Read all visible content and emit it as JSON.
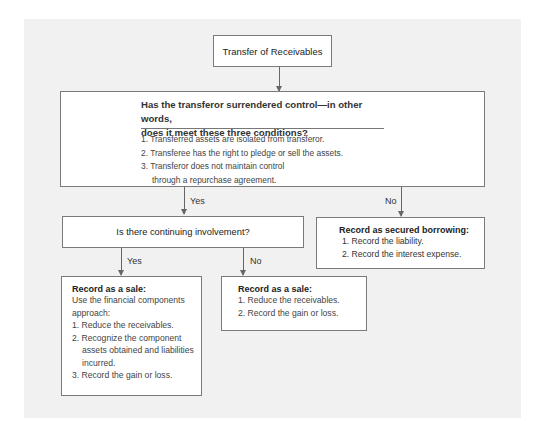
{
  "diagram": {
    "title": "Transfer of Receivables",
    "question": {
      "heading_line1": "Has the transferor surrendered control—in other words,",
      "heading_line2": "does it meet these three conditions?",
      "conditions": [
        "1. Transferred assets are isolated from transferor.",
        "2. Transferee has the right to pledge or sell the assets.",
        "3. Transferor does not maintain control through a repurchase agreement."
      ]
    },
    "branch_yes_label": "Yes",
    "branch_no_label": "No",
    "continuing_involvement": {
      "question": "Is there continuing involvement?",
      "yes_label": "Yes",
      "no_label": "No"
    },
    "secured_borrowing": {
      "title": "Record as secured borrowing:",
      "steps": [
        "1. Record the liability.",
        "2. Record the interest expense."
      ]
    },
    "sale_with_involvement": {
      "title": "Record as a sale:",
      "intro": "Use the financial components approach:",
      "steps": [
        "1. Reduce the receivables.",
        "2. Recognize the component assets obtained and liabilities incurred.",
        "3. Record the gain or loss."
      ]
    },
    "sale_without_involvement": {
      "title": "Record as a sale:",
      "steps": [
        "1. Reduce the receivables.",
        "2. Record the gain or loss."
      ]
    }
  },
  "colors": {
    "panel_background": "#f1f1f1",
    "box_background": "#ffffff",
    "border": "#7a7a7a",
    "arrow": "#666666"
  }
}
